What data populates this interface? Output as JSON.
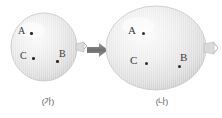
{
  "figure": {
    "background_color": "#ffffff",
    "balloon_fill": "#e6e6e6",
    "balloon_edge": "#bdbdbd",
    "point_color": "#2b2b2b",
    "label_color": "#3a3a3a",
    "caption_color": "#5a5a5a",
    "arrow_color": "#808080"
  },
  "balloons": [
    {
      "id": "small",
      "caption": "(가)",
      "state_label": "(가)",
      "points": [
        {
          "label": "A"
        },
        {
          "label": "C"
        },
        {
          "label": "B"
        }
      ],
      "nozzle": "balloon-nozzle"
    },
    {
      "id": "large",
      "caption": "(나)",
      "state_label": "(나)",
      "points": [
        {
          "label": "A"
        },
        {
          "label": "C"
        },
        {
          "label": "B"
        }
      ],
      "nozzle": "balloon-nozzle"
    }
  ],
  "arrow": {
    "icon": "arrow-right-icon",
    "direction": "right"
  }
}
